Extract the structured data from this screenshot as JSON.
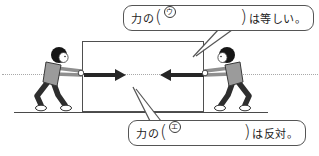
{
  "scene": {
    "description_names": {
      "box": "pushed-box",
      "left_person": "boy-pushing-right",
      "right_person": "boy-pushing-left",
      "left_arrow": "force-arrow-right",
      "right_arrow": "force-arrow-left",
      "dotted_line": "line-of-action-dotted-line",
      "ground": "ground-line"
    },
    "colors": {
      "arrow": "#262626",
      "box_border": "#4f4f4f",
      "shirt": "#9b9b9b",
      "pants": "#2e2e2e",
      "outline": "#333333",
      "callout_border": "#555555",
      "dotted_line": "#a8a8a8"
    }
  },
  "callouts": {
    "top": {
      "prefix": "力の",
      "open_paren": "(",
      "letter": "ウ",
      "close_paren": ")",
      "suffix": "は等しい。"
    },
    "bottom": {
      "prefix": "力の",
      "open_paren": "(",
      "letter": "エ",
      "close_paren": ")",
      "suffix": "は反対。"
    }
  }
}
